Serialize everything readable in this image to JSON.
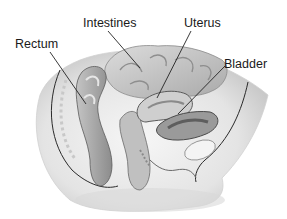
{
  "diagram": {
    "type": "anatomical-illustration",
    "labels": [
      {
        "id": "rectum",
        "text": "Rectum",
        "x": 15,
        "y": 38,
        "line": [
          50,
          52,
          86,
          104
        ]
      },
      {
        "id": "intestines",
        "text": "Intestines",
        "x": 83,
        "y": 17,
        "line": [
          108,
          31,
          140,
          68
        ]
      },
      {
        "id": "uterus",
        "text": "Uterus",
        "x": 184,
        "y": 17,
        "line": [
          191,
          31,
          157,
          98
        ]
      },
      {
        "id": "bladder",
        "text": "Bladder",
        "x": 224,
        "y": 58,
        "line": [
          225,
          66,
          178,
          114
        ]
      }
    ],
    "colors": {
      "background": "#ffffff",
      "label_text": "#1a1a1a",
      "leader_line": "#222222",
      "tissue_light": "#e9e9e9",
      "tissue_mid": "#bdbdbd",
      "tissue_dark": "#7d7d7d"
    }
  }
}
